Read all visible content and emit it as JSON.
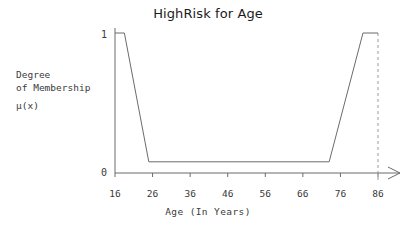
{
  "chart_data": {
    "type": "line",
    "title": "HighRisk for Age",
    "xlabel": "Age (In Years)",
    "ylabel": "Degree of Membership μ(x)",
    "ylabel_lines": [
      "Degree",
      "of Membership",
      "μ(x)"
    ],
    "xlim": [
      16,
      86
    ],
    "ylim": [
      0,
      1
    ],
    "x_ticks": [
      16,
      26,
      36,
      46,
      56,
      66,
      76,
      86
    ],
    "x_tick_labels": [
      "16",
      "26",
      "36",
      "46",
      "56",
      "66",
      "76",
      "86"
    ],
    "y_ticks": [
      0,
      1
    ],
    "y_tick_labels": [
      "0",
      "1"
    ],
    "grid": false,
    "legend": null,
    "series": [
      {
        "name": "HighRisk",
        "x": [
          16,
          18.5,
          25,
          73,
          82,
          86
        ],
        "values": [
          1,
          1,
          0.08,
          0.08,
          1,
          1
        ]
      }
    ],
    "annotations": [
      {
        "name": "right-boundary",
        "type": "dashed-vertical-line",
        "x": 86,
        "y_from": 0,
        "y_to": 1
      },
      {
        "name": "x-axis-arrow",
        "type": "arrowhead",
        "x": 86,
        "y": 0
      }
    ],
    "colors": {
      "curve": "#6b6b6b",
      "axis": "#6b6b6b",
      "dashed": "#9a9a9a",
      "text": "#3a3a3a",
      "title": "#1b1b1b",
      "background": "#ffffff"
    }
  }
}
